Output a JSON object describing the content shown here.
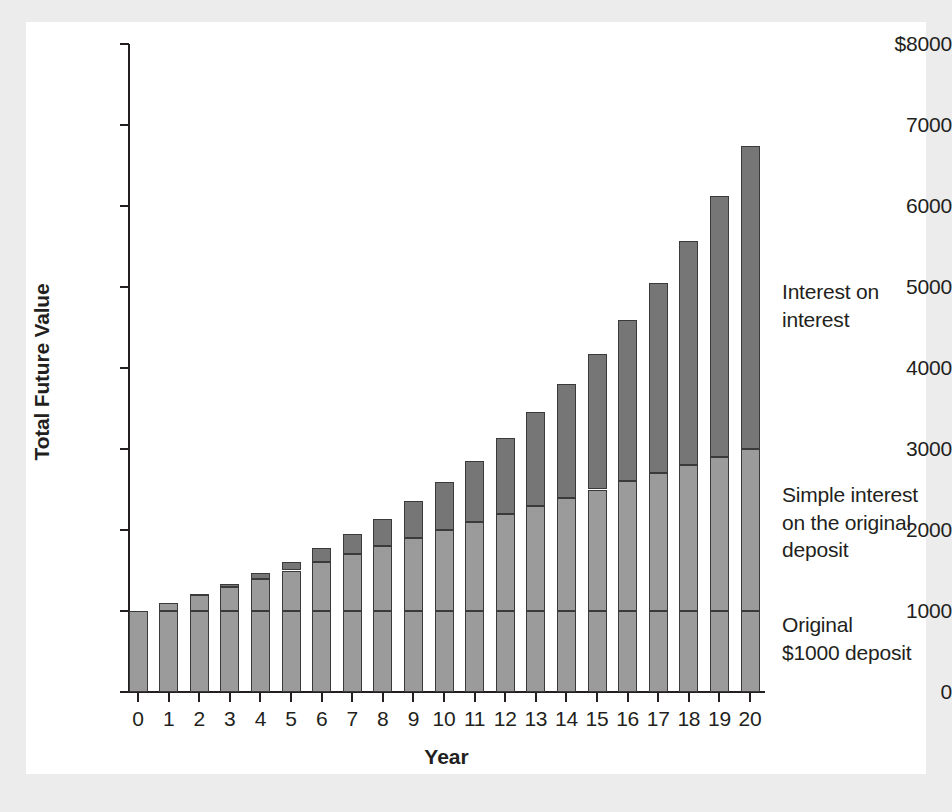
{
  "chart_data": {
    "type": "bar",
    "subtype": "stacked-bar",
    "title": "",
    "xlabel": "Year",
    "ylabel": "Total Future Value",
    "categories": [
      "0",
      "1",
      "2",
      "3",
      "4",
      "5",
      "6",
      "7",
      "8",
      "9",
      "10",
      "11",
      "12",
      "13",
      "14",
      "15",
      "16",
      "17",
      "18",
      "19",
      "20"
    ],
    "x_tick_labels": [
      "0",
      "1",
      "2",
      "3",
      "4",
      "5",
      "6",
      "7",
      "8",
      "9",
      "10",
      "11",
      "12",
      "13",
      "14",
      "15",
      "16",
      "17",
      "18",
      "19",
      "20"
    ],
    "y_tick_labels": [
      "$8000",
      "7000",
      "6000",
      "5000",
      "4000",
      "3000",
      "2000",
      "1000",
      "0"
    ],
    "y_tick_values": [
      8000,
      7000,
      6000,
      5000,
      4000,
      3000,
      2000,
      1000,
      0
    ],
    "ylim": [
      0,
      8000
    ],
    "xlim_categories": [
      0,
      20
    ],
    "grid": false,
    "legend": "annotations-at-right",
    "series": [
      {
        "name": "Original $1000 deposit",
        "color": "#9b9b9b",
        "values": [
          1000,
          1000,
          1000,
          1000,
          1000,
          1000,
          1000,
          1000,
          1000,
          1000,
          1000,
          1000,
          1000,
          1000,
          1000,
          1000,
          1000,
          1000,
          1000,
          1000,
          1000
        ]
      },
      {
        "name": "Simple interest on the original deposit",
        "color": "#9b9b9b",
        "values": [
          0,
          100,
          200,
          300,
          400,
          500,
          600,
          700,
          800,
          900,
          1000,
          1100,
          1200,
          1300,
          1400,
          1500,
          1600,
          1700,
          1800,
          1900,
          2000
        ]
      },
      {
        "name": "Interest on interest",
        "color": "#767676",
        "values": [
          0,
          0,
          10,
          31,
          64,
          105,
          172,
          249,
          336,
          458,
          594,
          753,
          938,
          1152,
          1397,
          1677,
          1995,
          2355,
          2763,
          3225,
          3745
        ]
      }
    ],
    "totals": [
      1000,
      1100,
      1210,
      1331,
      1464,
      1605,
      1772,
      1949,
      2136,
      2358,
      2594,
      2853,
      3138,
      3452,
      3797,
      4177,
      4595,
      5055,
      5563,
      6125,
      6745
    ],
    "annotations": [
      {
        "name": "interest-on-interest",
        "text": "Interest on\ninterest"
      },
      {
        "name": "simple-interest",
        "text": "Simple interest\non the original\ndeposit"
      },
      {
        "name": "original-deposit",
        "text": "Original\n$1000 deposit"
      }
    ],
    "colors": {
      "principal": "#9b9b9b",
      "simple_interest": "#9b9b9b",
      "interest_on_interest": "#767676",
      "axis": "#231f20",
      "plot_background": "#ffffff",
      "page_background": "#ececed",
      "bar_outline": "#3a3a3a"
    }
  }
}
